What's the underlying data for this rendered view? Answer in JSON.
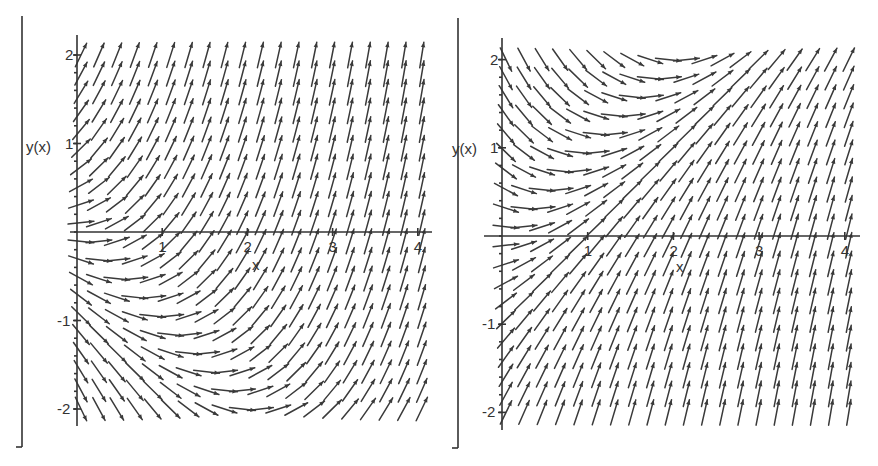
{
  "chart_data": [
    {
      "type": "direction-field",
      "title": "",
      "equation": "dy/dx = x + y",
      "xlabel": "x",
      "ylabel": "y(x)",
      "xlim": [
        0,
        4
      ],
      "ylim": [
        -2,
        2
      ],
      "x_ticks": [
        "1",
        "2",
        "3",
        "4"
      ],
      "y_ticks": [
        "2",
        "1",
        "-1",
        "-2"
      ],
      "x_tick_values": [
        1,
        2,
        3,
        4
      ],
      "y_tick_values": [
        2,
        1,
        -1,
        -2
      ],
      "grid_points": {
        "x_start": 0,
        "x_end": 4,
        "x_count": 20,
        "y_start": -2,
        "y_end": 2,
        "y_count": 20
      },
      "slope_sign_x": 1,
      "slope_sign_y": 1,
      "grid": false,
      "legend": "none"
    },
    {
      "type": "direction-field",
      "title": "",
      "equation": "dy/dx = x - y",
      "xlabel": "x",
      "ylabel": "y(x)",
      "xlim": [
        0,
        4
      ],
      "ylim": [
        -2,
        2
      ],
      "x_ticks": [
        "1",
        "2",
        "3",
        "4"
      ],
      "y_ticks": [
        "2",
        "1",
        "-1",
        "-2"
      ],
      "x_tick_values": [
        1,
        2,
        3,
        4
      ],
      "y_tick_values": [
        2,
        1,
        -1,
        -2
      ],
      "grid_points": {
        "x_start": 0,
        "x_end": 4,
        "x_count": 20,
        "y_start": -2,
        "y_end": 2,
        "y_count": 20
      },
      "slope_sign_x": 1,
      "slope_sign_y": -1,
      "grid": false,
      "legend": "none"
    }
  ]
}
